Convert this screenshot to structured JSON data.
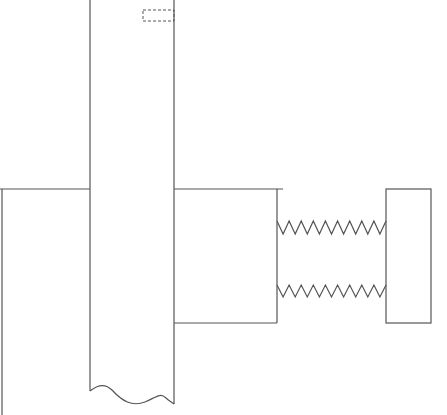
{
  "diagram": {
    "title": "",
    "components": [
      {
        "id": "shaft",
        "label": "",
        "type": "vertical shaft with broken end"
      },
      {
        "id": "key-slot",
        "label": "",
        "type": "hidden feature (dashed)"
      },
      {
        "id": "left-plate",
        "label": "",
        "type": "plate"
      },
      {
        "id": "center-block",
        "label": "",
        "type": "block"
      },
      {
        "id": "upper-spring",
        "label": "",
        "type": "spring"
      },
      {
        "id": "lower-spring",
        "label": "",
        "type": "spring"
      },
      {
        "id": "end-stop",
        "label": "",
        "type": "block"
      }
    ],
    "line_color": "#555555",
    "background": "#ffffff"
  }
}
